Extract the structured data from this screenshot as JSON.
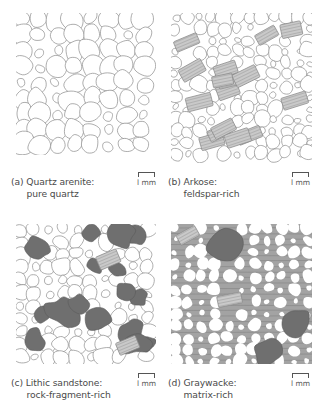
{
  "figure": {
    "panels": [
      {
        "id": "a",
        "letter": "(a)",
        "title": "Quartz arenite:",
        "subtitle": "pure quartz",
        "scale_label": "l mm",
        "rock_type": "quartz-arenite",
        "box": {
          "x": 16,
          "y": 13,
          "w": 140,
          "h": 142
        },
        "caption_pos": {
          "x": 11,
          "y": 176
        },
        "scale_pos": {
          "x": 137,
          "y": 172
        },
        "style": {
          "matrix": false,
          "feldspar_count": 0,
          "lithic_count": 0,
          "grain_size": 10.5,
          "packing": "tight"
        }
      },
      {
        "id": "b",
        "letter": "(b)",
        "title": "Arkose:",
        "subtitle": "feldspar-rich",
        "scale_label": "l mm",
        "rock_type": "arkose",
        "box": {
          "x": 171,
          "y": 13,
          "w": 141,
          "h": 150
        },
        "caption_pos": {
          "x": 168,
          "y": 176
        },
        "scale_pos": {
          "x": 291,
          "y": 172
        },
        "style": {
          "matrix": false,
          "feldspar_count": 16,
          "lithic_count": 0,
          "grain_size": 7.5,
          "packing": "tight"
        }
      },
      {
        "id": "c",
        "letter": "(c)",
        "title": "Lithic sandstone:",
        "subtitle": "rock-fragment-rich",
        "scale_label": "l mm",
        "rock_type": "lithic-sandstone",
        "box": {
          "x": 16,
          "y": 224,
          "w": 140,
          "h": 140
        },
        "caption_pos": {
          "x": 11,
          "y": 377
        },
        "scale_pos": {
          "x": 137,
          "y": 373
        },
        "style": {
          "matrix": false,
          "feldspar_count": 2,
          "lithic_count": 16,
          "grain_size": 8.5,
          "packing": "tight"
        }
      },
      {
        "id": "d",
        "letter": "(d)",
        "title": "Graywacke:",
        "subtitle": "matrix-rich",
        "scale_label": "l mm",
        "rock_type": "graywacke",
        "box": {
          "x": 171,
          "y": 224,
          "w": 141,
          "h": 140
        },
        "caption_pos": {
          "x": 168,
          "y": 377
        },
        "scale_pos": {
          "x": 291,
          "y": 373
        },
        "style": {
          "matrix": true,
          "feldspar_count": 2,
          "lithic_count": 3,
          "grain_size": 7,
          "packing": "loose"
        }
      }
    ],
    "legend_colors": {
      "background": "#ffffff",
      "grain_outline": "#8a8a8a",
      "quartz_fill": "#ffffff",
      "feldspar_fill": "#c9c9c9",
      "feldspar_stripes": "#a9a9a9",
      "lithic_fill": "#6f6f6f",
      "matrix_fill": "#a3a3a3",
      "matrix_lines": "#8c8c8c",
      "text": "#4a4a4a"
    }
  }
}
